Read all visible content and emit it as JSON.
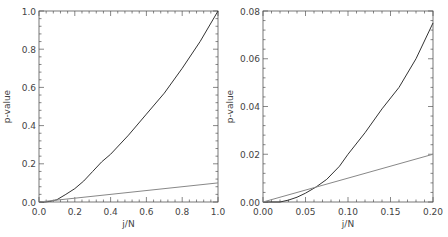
{
  "chart_data": [
    {
      "type": "line",
      "title": "",
      "xlabel": "j/N",
      "ylabel": "p-value",
      "xlim": [
        0.0,
        1.0
      ],
      "ylim": [
        0.0,
        1.0
      ],
      "xticks": [
        "0.0",
        "0.2",
        "0.4",
        "0.6",
        "0.8",
        "1.0"
      ],
      "yticks": [
        "0.0",
        "0.2",
        "0.4",
        "0.6",
        "0.8",
        "1.0"
      ],
      "xtick_values": [
        0,
        0.2,
        0.4,
        0.6,
        0.8,
        1.0
      ],
      "ytick_values": [
        0,
        0.2,
        0.4,
        0.6,
        0.8,
        1.0
      ],
      "series": [
        {
          "name": "p-value curve",
          "color": "#333333",
          "x": [
            0.0,
            0.03,
            0.06,
            0.1,
            0.15,
            0.2,
            0.25,
            0.3,
            0.35,
            0.4,
            0.5,
            0.6,
            0.7,
            0.8,
            0.9,
            1.0
          ],
          "y": [
            0.0,
            0.0,
            0.003,
            0.012,
            0.04,
            0.07,
            0.11,
            0.16,
            0.21,
            0.25,
            0.35,
            0.46,
            0.57,
            0.7,
            0.84,
            1.0
          ]
        },
        {
          "name": "reference line",
          "color": "#888888",
          "x": [
            0.0,
            1.0
          ],
          "y": [
            0.0,
            0.1
          ]
        }
      ]
    },
    {
      "type": "line",
      "title": "",
      "xlabel": "j/N",
      "ylabel": "p-value",
      "xlim": [
        0.0,
        0.2
      ],
      "ylim": [
        0.0,
        0.08
      ],
      "xticks": [
        "0.00",
        "0.05",
        "0.10",
        "0.15",
        "0.20"
      ],
      "yticks": [
        "0.00",
        "0.02",
        "0.04",
        "0.06",
        "0.08"
      ],
      "xtick_values": [
        0,
        0.05,
        0.1,
        0.15,
        0.2
      ],
      "ytick_values": [
        0,
        0.02,
        0.04,
        0.06,
        0.08
      ],
      "series": [
        {
          "name": "p-value curve",
          "color": "#333333",
          "x": [
            0.0,
            0.02,
            0.03,
            0.04,
            0.05,
            0.0625,
            0.075,
            0.09,
            0.1,
            0.12,
            0.14,
            0.16,
            0.18,
            0.2
          ],
          "y": [
            0.0,
            0.0,
            0.0008,
            0.002,
            0.0037,
            0.0063,
            0.0095,
            0.015,
            0.02,
            0.029,
            0.039,
            0.048,
            0.06,
            0.075
          ]
        },
        {
          "name": "reference line",
          "color": "#888888",
          "x": [
            0.0,
            0.2
          ],
          "y": [
            0.0,
            0.02
          ]
        }
      ]
    }
  ]
}
